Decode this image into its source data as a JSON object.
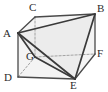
{
  "figure": {
    "background_color": "#ffffff",
    "solid_edge_color": "#4a4a4a",
    "hidden_edge_color": "#9a9a9a",
    "accent_edge_color": "#3a3a3a",
    "shade_fill_color": "#ececec",
    "face_fill_color": "#f4f4f4",
    "label_color": "#2b2b2b",
    "vertices": [
      {
        "name": "C",
        "label": "C",
        "x": 35,
        "y": 17,
        "label_x": 29,
        "label_y": 2
      },
      {
        "name": "B",
        "label": "B",
        "x": 95,
        "y": 14,
        "label_x": 97,
        "label_y": 3
      },
      {
        "name": "A",
        "label": "A",
        "x": 18,
        "y": 33,
        "label_x": 3,
        "label_y": 28
      },
      {
        "name": "G",
        "label": "G",
        "x": 35,
        "y": 57,
        "label_x": 26,
        "label_y": 51
      },
      {
        "name": "F",
        "label": "F",
        "x": 95,
        "y": 54,
        "label_x": 97,
        "label_y": 48
      },
      {
        "name": "D",
        "label": "D",
        "x": 18,
        "y": 77,
        "label_x": 4,
        "label_y": 72
      },
      {
        "name": "E",
        "label": "E",
        "x": 75,
        "y": 79,
        "label_x": 70,
        "label_y": 80
      }
    ],
    "solid_edges": [
      {
        "name": "edge-C-B",
        "from": "C",
        "to": "B"
      },
      {
        "name": "edge-A-C",
        "from": "A",
        "to": "C"
      },
      {
        "name": "edge-A-D",
        "from": "A",
        "to": "D"
      },
      {
        "name": "edge-D-E",
        "from": "D",
        "to": "E"
      },
      {
        "name": "edge-E-F",
        "from": "E",
        "to": "F"
      },
      {
        "name": "edge-F-B",
        "from": "F",
        "to": "B"
      }
    ],
    "hidden_edges": [
      {
        "name": "edge-C-G",
        "from": "C",
        "to": "G"
      },
      {
        "name": "edge-G-D",
        "from": "G",
        "to": "D"
      },
      {
        "name": "edge-G-F",
        "from": "G",
        "to": "F"
      }
    ],
    "accent_edges": [
      {
        "name": "edge-A-B",
        "from": "A",
        "to": "B"
      },
      {
        "name": "edge-A-G",
        "from": "A",
        "to": "G"
      },
      {
        "name": "edge-A-E",
        "from": "A",
        "to": "E"
      },
      {
        "name": "edge-B-E",
        "from": "B",
        "to": "E"
      },
      {
        "name": "edge-G-E",
        "from": "G",
        "to": "E"
      }
    ],
    "shaded_faces": [
      {
        "name": "face-A-B-E",
        "points": "A,B,E"
      },
      {
        "name": "face-A-G-E",
        "points": "A,G,E"
      }
    ],
    "outline_face": {
      "name": "face-prism-body",
      "points": "A,C,B,F,E,D"
    }
  }
}
